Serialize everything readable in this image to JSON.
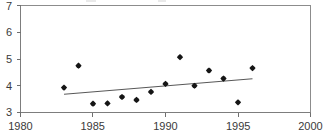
{
  "chart_data": {
    "type": "scatter",
    "title": "",
    "subtitle": "",
    "xlabel": "",
    "ylabel": "",
    "xlim": [
      1980,
      2000
    ],
    "ylim": [
      3,
      7
    ],
    "xticks": [
      1980,
      1985,
      1990,
      1995,
      2000
    ],
    "yticks": [
      3,
      4,
      5,
      6,
      7
    ],
    "xtick_labels": [
      "1980",
      "1985",
      "1990",
      "1995",
      "2000"
    ],
    "ytick_labels": [
      "3",
      "4",
      "5",
      "6",
      "7"
    ],
    "grid": false,
    "legend": null,
    "annotations": [],
    "marker_style": "filled-diamond",
    "x": [
      1983,
      1984,
      1985,
      1986,
      1987,
      1988,
      1989,
      1990,
      1991,
      1992,
      1993,
      1994,
      1995,
      1996
    ],
    "values": [
      3.93,
      4.75,
      3.33,
      3.34,
      3.58,
      3.47,
      3.77,
      4.07,
      5.07,
      4.0,
      4.57,
      4.27,
      3.38,
      4.66
    ],
    "series": [
      {
        "name": "observations",
        "type": "scatter",
        "x": [
          1983,
          1984,
          1985,
          1986,
          1987,
          1988,
          1989,
          1990,
          1991,
          1992,
          1993,
          1994,
          1995,
          1996
        ],
        "values": [
          3.93,
          4.75,
          3.33,
          3.34,
          3.58,
          3.47,
          3.77,
          4.07,
          5.07,
          4.0,
          4.57,
          4.27,
          3.38,
          4.66
        ],
        "color": "#151515"
      },
      {
        "name": "trend-line",
        "type": "line",
        "x": [
          1983,
          1996
        ],
        "values": [
          3.68,
          4.26
        ],
        "color": "#585858"
      }
    ],
    "colors": {
      "marker": "#151515",
      "trend": "#585858",
      "axis": "#7d7d7d",
      "frame": "#8c8c8c",
      "tick_text": "#3a3a3a",
      "background": "#ffffff"
    }
  }
}
